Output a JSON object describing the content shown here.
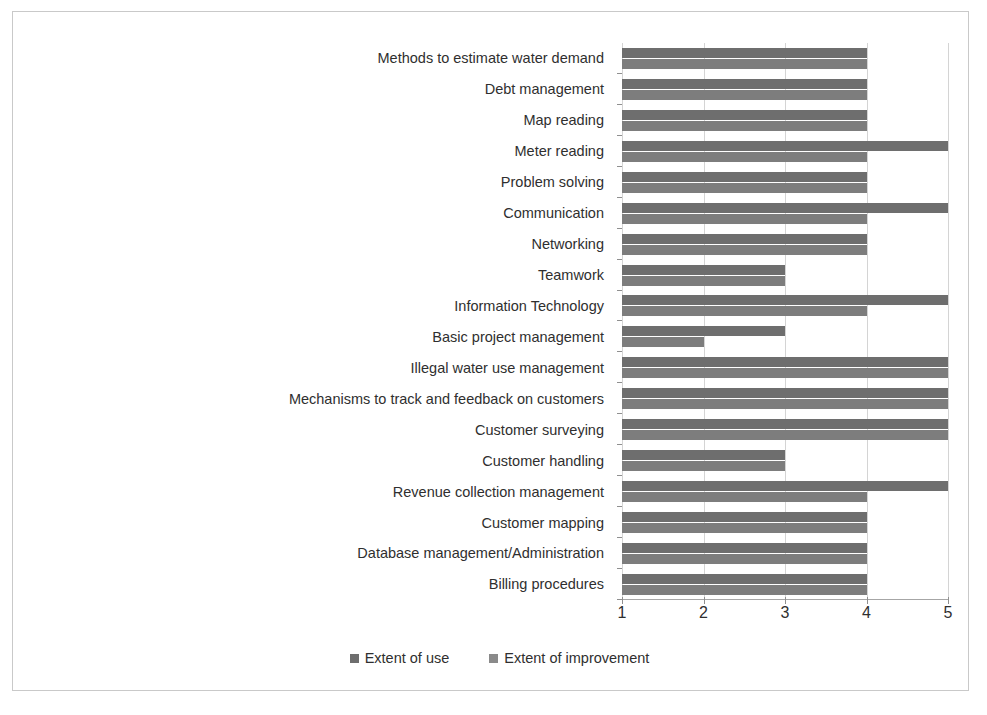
{
  "figure": {
    "border_color": "#c9c9c9",
    "background": "#ffffff"
  },
  "chart_data": {
    "type": "bar",
    "orientation": "horizontal",
    "title": "",
    "subtitle": "",
    "xlabel": "",
    "ylabel": "",
    "xlim": [
      1,
      5
    ],
    "xticks": [
      "1",
      "2",
      "3",
      "4",
      "5"
    ],
    "grid": true,
    "grid_axis": "x",
    "legend_position": "bottom-center",
    "categories": [
      "Methods to estimate water demand",
      "Debt management",
      "Map reading",
      "Meter reading",
      "Problem solving",
      "Communication",
      "Networking",
      "Teamwork",
      "Information Technology",
      "Basic project management",
      "Illegal water use management",
      "Mechanisms to track and feedback on customers",
      "Customer surveying",
      "Customer handling",
      "Revenue collection management",
      "Customer mapping",
      "Database management/Administration",
      "Billing procedures"
    ],
    "series": [
      {
        "name": "Extent of use",
        "color": "#6e6e6e",
        "values": [
          4,
          4,
          4,
          5,
          4,
          5,
          4,
          3,
          5,
          3,
          5,
          5,
          5,
          3,
          5,
          4,
          4,
          4
        ]
      },
      {
        "name": "Extent of improvement",
        "color": "#7d7d7d",
        "values": [
          4,
          4,
          4,
          4,
          4,
          4,
          4,
          3,
          4,
          2,
          5,
          5,
          5,
          3,
          4,
          4,
          4,
          4
        ]
      }
    ]
  },
  "legend": {
    "items": [
      {
        "label": "Extent of use",
        "color": "#6e6e6e"
      },
      {
        "label": "Extent of improvement",
        "color": "#8a8a8a"
      }
    ]
  }
}
